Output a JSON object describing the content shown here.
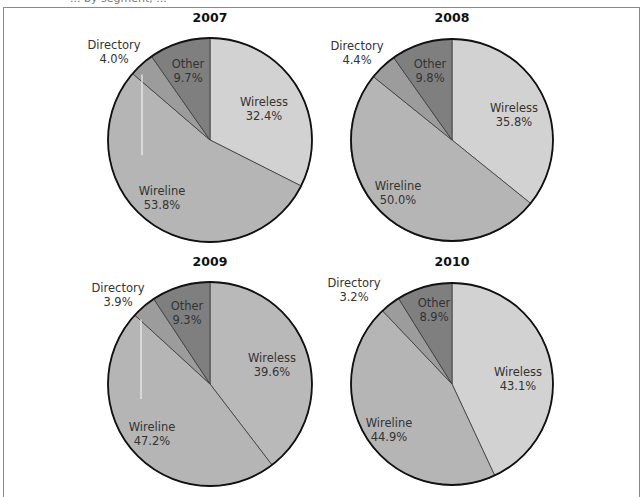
{
  "header": {
    "partial_text": "... by segment, ..."
  },
  "colors": {
    "wireless": "#d4d4d4",
    "wireline": "#b4b4b4",
    "directory": "#9a9a9a",
    "other": "#7d7d7d",
    "outline": "#111111",
    "frame": "#8a8a8a"
  },
  "chart_data": [
    {
      "type": "pie",
      "title": "2007",
      "categories": [
        "Wireless",
        "Wireline",
        "Directory",
        "Other"
      ],
      "values": [
        32.4,
        53.8,
        4.0,
        9.7
      ],
      "labels": [
        "Wireless\n32.4%",
        "Wireline\n53.8%",
        "Directory\n4.0%",
        "Other\n9.7%"
      ],
      "start_angle": "12 o'clock, clockwise"
    },
    {
      "type": "pie",
      "title": "2008",
      "categories": [
        "Wireless",
        "Wireline",
        "Directory",
        "Other"
      ],
      "values": [
        35.8,
        50.0,
        4.4,
        9.8
      ],
      "labels": [
        "Wireless\n35.8%",
        "Wireline\n50.0%",
        "Directory\n4.4%",
        "Other\n9.8%"
      ],
      "start_angle": "12 o'clock, clockwise"
    },
    {
      "type": "pie",
      "title": "2009",
      "categories": [
        "Wireless",
        "Wireline",
        "Directory",
        "Other"
      ],
      "values": [
        39.6,
        47.2,
        3.9,
        9.3
      ],
      "labels": [
        "Wireless\n39.6%",
        "Wireline\n47.2%",
        "Directory\n3.9%",
        "Other\n9.3%"
      ],
      "start_angle": "12 o'clock, clockwise"
    },
    {
      "type": "pie",
      "title": "2010",
      "categories": [
        "Wireless",
        "Wireline",
        "Directory",
        "Other"
      ],
      "values": [
        43.1,
        44.9,
        3.2,
        8.9
      ],
      "labels": [
        "Wireless\n43.1%",
        "Wireline\n44.9%",
        "Directory\n3.2%",
        "Other\n8.9%"
      ],
      "start_angle": "12 o'clock, clockwise"
    }
  ],
  "pies": [
    {
      "title": "2007",
      "cx": 210,
      "cy": 140,
      "r": 102,
      "title_x": 210,
      "title_y": 22,
      "fills": [
        "#d2d2d2",
        "#b5b5b5",
        "#9c9c9c",
        "#7f7f7f"
      ],
      "artifact_x": 142,
      "label_pos": [
        {
          "name": "Wireless",
          "pct": "32.4%",
          "x": 264,
          "y": 106
        },
        {
          "name": "Wireline",
          "pct": "53.8%",
          "x": 162,
          "y": 195
        },
        {
          "name": "Directory",
          "pct": "4.0%",
          "x": 114,
          "y": 49
        },
        {
          "name": "Other",
          "pct": "9.7%",
          "x": 188,
          "y": 68
        }
      ]
    },
    {
      "title": "2008",
      "cx": 452,
      "cy": 140,
      "r": 101,
      "title_x": 452,
      "title_y": 22,
      "fills": [
        "#d2d2d2",
        "#b5b5b5",
        "#9c9c9c",
        "#7f7f7f"
      ],
      "artifact_x": null,
      "label_pos": [
        {
          "name": "Wireless",
          "pct": "35.8%",
          "x": 514,
          "y": 112
        },
        {
          "name": "Wireline",
          "pct": "50.0%",
          "x": 398,
          "y": 190
        },
        {
          "name": "Directory",
          "pct": "4.4%",
          "x": 357,
          "y": 50
        },
        {
          "name": "Other",
          "pct": "9.8%",
          "x": 430,
          "y": 68
        }
      ]
    },
    {
      "title": "2009",
      "cx": 210,
      "cy": 384,
      "r": 102,
      "title_x": 210,
      "title_y": 266,
      "fills": [
        "#b9b9b9",
        "#b5b5b5",
        "#9c9c9c",
        "#7f7f7f"
      ],
      "artifact_x": 141,
      "label_pos": [
        {
          "name": "Wireless",
          "pct": "39.6%",
          "x": 272,
          "y": 362
        },
        {
          "name": "Wireline",
          "pct": "47.2%",
          "x": 152,
          "y": 431
        },
        {
          "name": "Directory",
          "pct": "3.9%",
          "x": 118,
          "y": 292
        },
        {
          "name": "Other",
          "pct": "9.3%",
          "x": 187,
          "y": 310
        }
      ]
    },
    {
      "title": "2010",
      "cx": 452,
      "cy": 384,
      "r": 101,
      "title_x": 452,
      "title_y": 266,
      "fills": [
        "#d2d2d2",
        "#b5b5b5",
        "#9c9c9c",
        "#7f7f7f"
      ],
      "artifact_x": null,
      "label_pos": [
        {
          "name": "Wireless",
          "pct": "43.1%",
          "x": 518,
          "y": 376
        },
        {
          "name": "Wireline",
          "pct": "44.9%",
          "x": 389,
          "y": 427
        },
        {
          "name": "Directory",
          "pct": "3.2%",
          "x": 354,
          "y": 287
        },
        {
          "name": "Other",
          "pct": "8.9%",
          "x": 434,
          "y": 307
        }
      ]
    }
  ]
}
